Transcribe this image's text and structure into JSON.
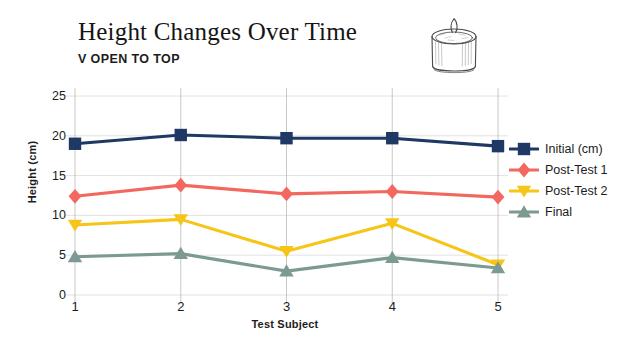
{
  "header": {
    "title": "Height Changes Over Time",
    "subtitle": "V OPEN TO TOP"
  },
  "illustration": {
    "name": "candle-can-sketch"
  },
  "chart_data": {
    "type": "line",
    "title": "Height Changes Over Time",
    "subtitle": "V OPEN TO TOP",
    "xlabel": "Test Subject",
    "ylabel": "Height (cm)",
    "categories": [
      "1",
      "2",
      "3",
      "4",
      "5"
    ],
    "x": [
      1,
      2,
      3,
      4,
      5
    ],
    "xlim": [
      1,
      5
    ],
    "ylim": [
      0,
      25
    ],
    "yticks": [
      0,
      5,
      10,
      15,
      20,
      25
    ],
    "xticks": [
      "1",
      "2",
      "3",
      "4",
      "5"
    ],
    "grid": "horizontal",
    "legend_position": "right",
    "series": [
      {
        "name": "Initial (cm)",
        "color": "#1F3864",
        "marker": "square",
        "values": [
          19.0,
          20.1,
          19.7,
          19.7,
          18.7
        ]
      },
      {
        "name": "Post-Test 1",
        "color": "#F2685E",
        "marker": "diamond",
        "values": [
          12.4,
          13.8,
          12.7,
          13.0,
          12.3
        ]
      },
      {
        "name": "Post-Test 2",
        "color": "#F5C518",
        "marker": "triangle-down",
        "values": [
          8.8,
          9.5,
          5.5,
          9.0,
          3.8
        ]
      },
      {
        "name": "Final",
        "color": "#7C9A92",
        "marker": "triangle-up",
        "values": [
          4.8,
          5.2,
          3.0,
          4.7,
          3.4
        ]
      }
    ]
  },
  "colors": {
    "initial": "#1F3864",
    "post_test_1": "#F2685E",
    "post_test_2": "#F5C518",
    "final": "#7C9A92",
    "grid": "#e2e2e2",
    "axis": "#b9b9b9",
    "background": "#ffffff"
  }
}
